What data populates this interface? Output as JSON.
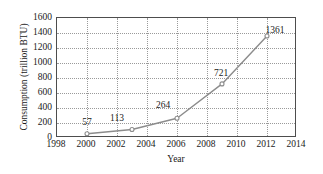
{
  "chart_data": {
    "type": "line",
    "title": "",
    "xlabel": "Year",
    "ylabel": "Consumption (trillion BTU)",
    "xlim": [
      1998,
      2014
    ],
    "ylim": [
      0,
      1600
    ],
    "xticks": [
      "1998",
      "2000",
      "2002",
      "2004",
      "2006",
      "2008",
      "2010",
      "2012",
      "2014"
    ],
    "yticks": [
      "0",
      "200",
      "400",
      "600",
      "800",
      "1000",
      "1200",
      "1400",
      "1600"
    ],
    "grid": true,
    "legend": false,
    "marker": "open-circle",
    "line_color": "#8c8c8c",
    "x": [
      2000,
      2003,
      2006,
      2009,
      2012
    ],
    "values": [
      57,
      113,
      264,
      721,
      1361
    ],
    "point_labels": [
      "57",
      "113",
      "264",
      "721",
      "1361"
    ],
    "series": [
      {
        "name": "Consumption",
        "x": [
          2000,
          2003,
          2006,
          2009,
          2012
        ],
        "values": [
          57,
          113,
          264,
          721,
          1361
        ]
      }
    ]
  },
  "axes": {
    "y_title": "Consumption (trillion BTU)",
    "x_title": "Year",
    "y_tick_labels": [
      "1600",
      "1400",
      "1200",
      "1000",
      "800",
      "600",
      "400",
      "200",
      "0"
    ],
    "x_tick_labels": [
      "1998",
      "2000",
      "2002",
      "2004",
      "2006",
      "2008",
      "2010",
      "2012",
      "2014"
    ]
  },
  "labels": {
    "p0": "57",
    "p1": "113",
    "p2": "264",
    "p3": "721",
    "p4": "1361"
  },
  "colors": {
    "line": "#8c8c8c",
    "marker_stroke": "#8c8c8c",
    "marker_fill": "#ffffff",
    "grid": "#9a9a9a",
    "frame": "#4d4d4d",
    "text": "#1a1a1a",
    "background": "#ffffff"
  }
}
